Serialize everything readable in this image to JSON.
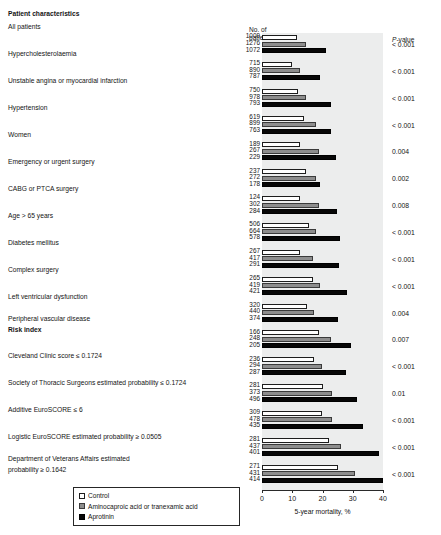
{
  "header": {
    "patients_line1": "No. of",
    "patients_line2": "patients",
    "mortality": "5-year mortality",
    "pvalue_prefix": "P",
    "pvalue_suffix": "-value",
    "col_characteristics": "Patient characteristics"
  },
  "legend": {
    "items": [
      {
        "label": "Control",
        "color": "#ffffff",
        "swatch": "sw-ctrl"
      },
      {
        "label": "Aminocaproic acid or tranexamic acid",
        "color": "#8d8d8d",
        "swatch": "sw-amino"
      },
      {
        "label": "Aprotinin",
        "color": "#070707",
        "swatch": "sw-apro"
      }
    ]
  },
  "axis": {
    "label": "5-year mortality, %",
    "ticks": [
      "0",
      "10",
      "20",
      "30",
      "40"
    ],
    "min": 0,
    "max": 40
  },
  "section_headers": [
    {
      "label": "Patient characteristics",
      "row": 0
    },
    {
      "label": "Risk index",
      "row": 11
    }
  ],
  "chart_data": {
    "type": "bar",
    "orientation": "horizontal",
    "title": "5-year mortality",
    "xlabel": "5-year mortality, %",
    "ylabel": "",
    "xlim": [
      0,
      40
    ],
    "grid": false,
    "legend_position": "bottom-left",
    "series": [
      {
        "name": "Control",
        "color": "#ffffff"
      },
      {
        "name": "Aminocaproic acid or tranexamic acid",
        "color": "#8d8d8d"
      },
      {
        "name": "Aprotinin",
        "color": "#070707"
      }
    ],
    "categories": [
      "All patients",
      "Hypercholesterolaemia",
      "Unstable angina or myocardial infarction",
      "Hypertension",
      "Women",
      "Emergency or urgent surgery",
      "CABG or PTCA surgery",
      "Age > 65 years",
      "Diabetes mellitus",
      "Complex surgery",
      "Left ventricular dysfunction",
      "Peripheral vascular disease",
      "Cleveland Clinic score ≤ 0.1724",
      "Society of Thoracic Surgeons estimated probability ≤ 0.1724",
      "Additive EuroSCORE ≤ 6",
      "Logistic EuroSCORE estimated probability ≥ 0.0505",
      "Department of Veterans Affairs estimated probability ≥ 0.1642"
    ],
    "rows": [
      {
        "label": "All patients",
        "n": [
          1009,
          1276,
          1072
        ],
        "values": [
          11.7,
          14.7,
          21.3
        ],
        "p": "< 0.001"
      },
      {
        "label": "Hypercholesterolaemia",
        "n": [
          715,
          890,
          787
        ],
        "values": [
          10.0,
          12.7,
          19.3
        ],
        "p": "< 0.001"
      },
      {
        "label": "Unstable angina or myocardial infarction",
        "n": [
          750,
          978,
          793
        ],
        "values": [
          12.0,
          14.7,
          22.7
        ],
        "p": "< 0.001"
      },
      {
        "label": "Hypertension",
        "n": [
          619,
          899,
          763
        ],
        "values": [
          14.0,
          18.0,
          22.7
        ],
        "p": "< 0.001"
      },
      {
        "label": "Women",
        "n": [
          189,
          267,
          229
        ],
        "values": [
          12.7,
          18.7,
          24.3
        ],
        "p": "0.004"
      },
      {
        "label": "Emergency or urgent surgery",
        "n": [
          237,
          272,
          178
        ],
        "values": [
          14.7,
          17.7,
          19.3
        ],
        "p": "0.002"
      },
      {
        "label": "CABG or PTCA surgery",
        "n": [
          124,
          302,
          284
        ],
        "values": [
          12.7,
          19.0,
          24.7
        ],
        "p": "0.008"
      },
      {
        "label": "Age > 65 years",
        "n": [
          506,
          664,
          578
        ],
        "values": [
          15.7,
          18.0,
          25.7
        ],
        "p": "< 0.001"
      },
      {
        "label": "Diabetes mellitus",
        "n": [
          267,
          417,
          291
        ],
        "values": [
          12.7,
          16.7,
          25.3
        ],
        "p": "< 0.001"
      },
      {
        "label": "Complex surgery",
        "n": [
          265,
          419,
          421
        ],
        "values": [
          16.7,
          19.3,
          28.0
        ],
        "p": "< 0.001"
      },
      {
        "label": "Left ventricular dysfunction",
        "n": [
          320,
          440,
          374
        ],
        "values": [
          15.0,
          17.3,
          25.0
        ],
        "p": "0.004"
      },
      {
        "label": "Peripheral vascular disease",
        "n": [
          166,
          248,
          205
        ],
        "values": [
          18.7,
          22.7,
          29.3
        ],
        "p": "0.007"
      },
      {
        "label": "Cleveland Clinic score ≤ 0.1724",
        "n": [
          236,
          294,
          287
        ],
        "values": [
          17.3,
          19.7,
          27.7
        ],
        "p": "< 0.001"
      },
      {
        "label": "Society of Thoracic Surgeons estimated probability ≤ 0.1724",
        "n": [
          281,
          373,
          496
        ],
        "values": [
          20.0,
          23.3,
          31.3
        ],
        "p": "0.01"
      },
      {
        "label": "Additive EuroSCORE ≤ 6",
        "n": [
          309,
          478,
          435
        ],
        "values": [
          19.7,
          23.3,
          33.3
        ],
        "p": "< 0.001"
      },
      {
        "label": "Logistic EuroSCORE estimated probability ≥ 0.0505",
        "n": [
          281,
          437,
          401
        ],
        "values": [
          22.0,
          26.0,
          38.7
        ],
        "p": "< 0.001"
      },
      {
        "label": "Department of Veterans Affairs estimated probability ≥ 0.1642",
        "n": [
          271,
          431,
          414
        ],
        "values": [
          25.0,
          30.7,
          40.0
        ],
        "p": "< 0.001"
      }
    ]
  }
}
